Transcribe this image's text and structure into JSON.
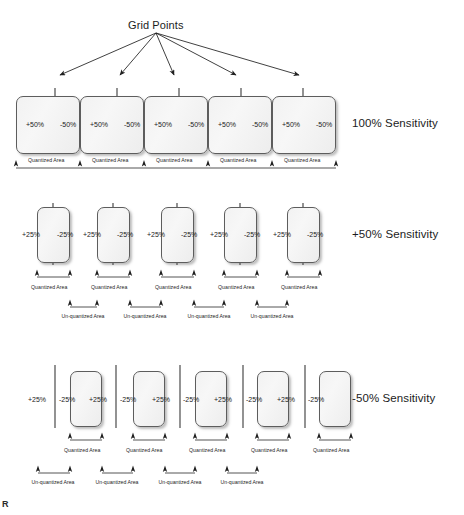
{
  "figure": {
    "title": "Grid Points",
    "corner_mark": "R"
  },
  "rows": [
    {
      "id": "row-100",
      "sensitivity_label": "100% Sensitivity",
      "cells": [
        {
          "left_pct": "+50%",
          "right_pct": "-50%",
          "quantized_label": "Quantized Area"
        },
        {
          "left_pct": "+50%",
          "right_pct": "-50%",
          "quantized_label": "Quantized Area"
        },
        {
          "left_pct": "+50%",
          "right_pct": "-50%",
          "quantized_label": "Quantized Area"
        },
        {
          "left_pct": "+50%",
          "right_pct": "-50%",
          "quantized_label": "Quantized Area"
        },
        {
          "left_pct": "+50%",
          "right_pct": "-50%",
          "quantized_label": "Quantized Area"
        }
      ],
      "unquantized_labels": []
    },
    {
      "id": "row-plus50",
      "sensitivity_label": "+50% Sensitivity",
      "cells": [
        {
          "left_pct": "+25%",
          "right_pct": "-25%",
          "quantized_label": "Quantized Area"
        },
        {
          "left_pct": "+25%",
          "right_pct": "-25%",
          "quantized_label": "Quantized Area"
        },
        {
          "left_pct": "+25%",
          "right_pct": "-25%",
          "quantized_label": "Quantized Area"
        },
        {
          "left_pct": "+25%",
          "right_pct": "-25%",
          "quantized_label": "Quantized Area"
        },
        {
          "left_pct": "+25%",
          "right_pct": "-25%",
          "quantized_label": "Quantized Area"
        }
      ],
      "unquantized_labels": [
        "Un-quantized Area",
        "Un-quantized Area",
        "Un-quantized Area",
        "Un-quantized Area"
      ]
    },
    {
      "id": "row-minus50",
      "sensitivity_label": "-50% Sensitivity",
      "cells": [
        {
          "left_pct": "+25%",
          "right_pct": "-25%",
          "far_pct": "+25%",
          "quantized_label": "Quantized Area"
        },
        {
          "left_pct": "+25%",
          "right_pct": "-25%",
          "far_pct": "+25%",
          "quantized_label": "Quantized Area"
        },
        {
          "left_pct": "+25%",
          "right_pct": "-25%",
          "far_pct": "+25%",
          "quantized_label": "Quantized Area"
        },
        {
          "left_pct": "+25%",
          "right_pct": "-25%",
          "far_pct": "+25%",
          "quantized_label": "Quantized Area"
        },
        {
          "left_pct": "+25%",
          "right_pct": "-25%",
          "far_pct": "",
          "quantized_label": "Quantized Area"
        }
      ],
      "unquantized_labels": [
        "Un-quantized Area",
        "Un-quantized Area",
        "Un-quantized Area",
        "Un-quantized Area"
      ]
    }
  ],
  "colors": {
    "box_fill": "#f2f2f2",
    "box_stroke": "#5d5d5d",
    "line": "#3a3a3a",
    "text": "#1c1c1c"
  }
}
